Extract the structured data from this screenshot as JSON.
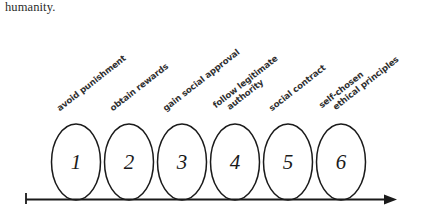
{
  "page": {
    "caption_text": "humanity.",
    "background_color": "#ffffff",
    "ink_color": "#1a1a1a"
  },
  "diagram": {
    "type": "stage-progression",
    "axis": {
      "name": "progression-arrow",
      "direction": "left-to-right",
      "start_tick": true,
      "arrowhead": true
    },
    "stages": [
      {
        "number": "1",
        "label_line1": "avoid punishment",
        "label_line2": ""
      },
      {
        "number": "2",
        "label_line1": "obtain rewards",
        "label_line2": ""
      },
      {
        "number": "3",
        "label_line1": "gain social approval",
        "label_line2": ""
      },
      {
        "number": "4",
        "label_line1": "follow legitimate",
        "label_line2": "authority"
      },
      {
        "number": "5",
        "label_line1": "social contract",
        "label_line2": ""
      },
      {
        "number": "6",
        "label_line1": "self-chosen",
        "label_line2": "ethical principles"
      }
    ]
  }
}
